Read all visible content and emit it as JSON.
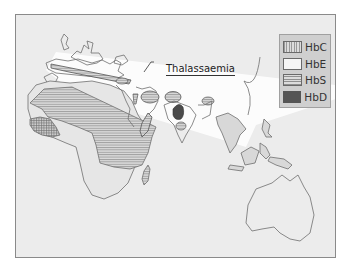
{
  "map": {
    "type": "distribution map",
    "region": "Old World (Europe, Africa, Middle East, South & Southeast Asia, Australia)",
    "callout_label": "Thalassaemia",
    "legend": {
      "items": [
        {
          "label": "HbC",
          "pattern": "vertical-hatch",
          "color": "#9a9a9a"
        },
        {
          "label": "HbE",
          "pattern": "solid-light",
          "color": "#f6f6f6"
        },
        {
          "label": "HbS",
          "pattern": "horizontal-hatch",
          "color": "#8f8f8f"
        },
        {
          "label": "HbD",
          "pattern": "solid-dark",
          "color": "#555555"
        }
      ]
    },
    "colors": {
      "background": "#ececec",
      "land_outline": "#6e6e6e",
      "thalassaemia_band": "#ffffff",
      "legend_box": "#cfcfcf"
    }
  }
}
